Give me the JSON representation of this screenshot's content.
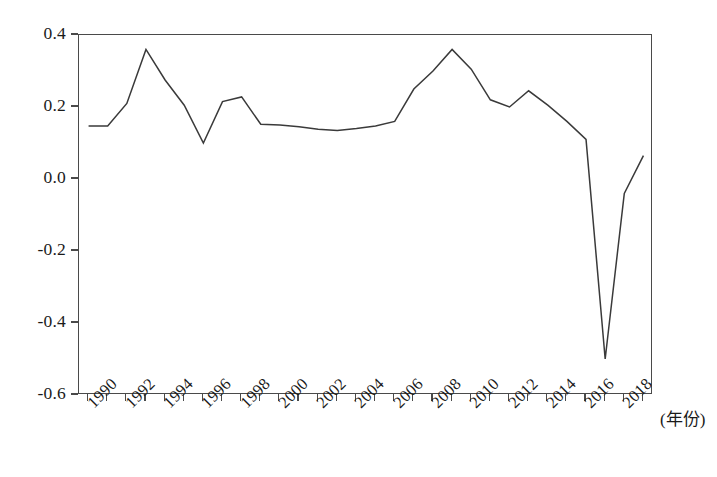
{
  "chart_data": {
    "type": "line",
    "title": "",
    "subtitle": "",
    "xlabel": "(年份)",
    "ylabel": "",
    "xlim": [
      1989.5,
      2019.5
    ],
    "ylim": [
      -0.6,
      0.4
    ],
    "grid": false,
    "legend": null,
    "legend_position": "none",
    "line_color": "#3a3a3a",
    "axis_color": "#4a4a4a",
    "x": [
      1990,
      1991,
      1992,
      1993,
      1994,
      1995,
      1996,
      1997,
      1998,
      1999,
      2000,
      2001,
      2002,
      2003,
      2004,
      2005,
      2006,
      2007,
      2008,
      2009,
      2010,
      2011,
      2012,
      2013,
      2014,
      2015,
      2016,
      2017,
      2018,
      2019
    ],
    "values": [
      0.147,
      0.147,
      0.21,
      0.36,
      0.275,
      0.205,
      0.1,
      0.215,
      0.228,
      0.152,
      0.15,
      0.145,
      0.138,
      0.135,
      0.14,
      0.147,
      0.16,
      0.25,
      0.3,
      0.36,
      0.305,
      0.22,
      0.2,
      0.245,
      0.205,
      0.16,
      0.11,
      -0.5,
      -0.04,
      0.065
    ],
    "x_tick_values": [
      1990,
      1992,
      1994,
      1996,
      1998,
      2000,
      2002,
      2004,
      2006,
      2008,
      2010,
      2012,
      2014,
      2016,
      2018
    ],
    "x_tick_labels": [
      "1990",
      "1992",
      "1994",
      "1996",
      "1998",
      "2000",
      "2002",
      "2004",
      "2006",
      "2008",
      "2010",
      "2012",
      "2014",
      "2016",
      "2018"
    ],
    "y_tick_values": [
      0.4,
      0.2,
      0.0,
      -0.2,
      -0.4,
      -0.6
    ],
    "y_tick_labels": [
      "0.4",
      "0.2",
      "0.0",
      "-0.2",
      "-0.4",
      "-0.6"
    ]
  }
}
